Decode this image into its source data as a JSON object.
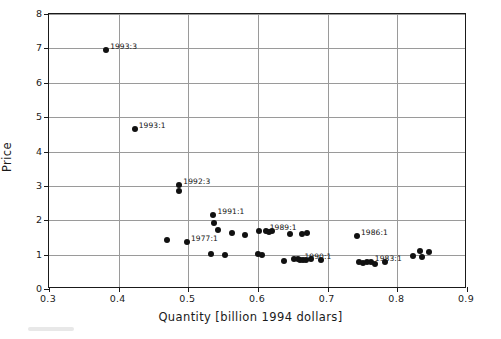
{
  "chart_data": {
    "type": "scatter",
    "title": "",
    "xlabel": "Quantity [billion 1994 dollars]",
    "ylabel": "Price",
    "xlim": [
      0.3,
      0.9
    ],
    "ylim": [
      0,
      8
    ],
    "xticks": [
      "0.3",
      "0.4",
      "0.5",
      "0.6",
      "0.7",
      "0.8",
      "0.9"
    ],
    "xtick_values": [
      0.3,
      0.4,
      0.5,
      0.6,
      0.7,
      0.8,
      0.9
    ],
    "yticks": [
      "0",
      "1",
      "2",
      "3",
      "4",
      "5",
      "6",
      "7",
      "8"
    ],
    "ytick_values": [
      0,
      1,
      2,
      3,
      4,
      5,
      6,
      7,
      8
    ],
    "grid": true,
    "legend": null,
    "marker": "filled-circle",
    "marker_color": "#111111",
    "points": [
      {
        "x": 0.382,
        "y": 6.95
      },
      {
        "x": 0.423,
        "y": 4.65
      },
      {
        "x": 0.487,
        "y": 3.02
      },
      {
        "x": 0.486,
        "y": 2.86
      },
      {
        "x": 0.536,
        "y": 2.15
      },
      {
        "x": 0.537,
        "y": 1.93
      },
      {
        "x": 0.543,
        "y": 1.72
      },
      {
        "x": 0.47,
        "y": 1.43
      },
      {
        "x": 0.498,
        "y": 1.38
      },
      {
        "x": 0.563,
        "y": 1.63
      },
      {
        "x": 0.582,
        "y": 1.56
      },
      {
        "x": 0.533,
        "y": 1.02
      },
      {
        "x": 0.552,
        "y": 0.98
      },
      {
        "x": 0.601,
        "y": 1.7
      },
      {
        "x": 0.611,
        "y": 1.68
      },
      {
        "x": 0.616,
        "y": 1.67
      },
      {
        "x": 0.62,
        "y": 1.7
      },
      {
        "x": 0.6,
        "y": 1.01
      },
      {
        "x": 0.606,
        "y": 1.0
      },
      {
        "x": 0.646,
        "y": 1.59
      },
      {
        "x": 0.663,
        "y": 1.6
      },
      {
        "x": 0.67,
        "y": 1.62
      },
      {
        "x": 0.637,
        "y": 0.82
      },
      {
        "x": 0.651,
        "y": 0.87
      },
      {
        "x": 0.657,
        "y": 0.86
      },
      {
        "x": 0.661,
        "y": 0.84
      },
      {
        "x": 0.665,
        "y": 0.83
      },
      {
        "x": 0.669,
        "y": 0.85
      },
      {
        "x": 0.676,
        "y": 0.86
      },
      {
        "x": 0.69,
        "y": 0.85
      },
      {
        "x": 0.742,
        "y": 1.55
      },
      {
        "x": 0.745,
        "y": 0.78
      },
      {
        "x": 0.751,
        "y": 0.77
      },
      {
        "x": 0.757,
        "y": 0.79
      },
      {
        "x": 0.762,
        "y": 0.78
      },
      {
        "x": 0.768,
        "y": 0.72
      },
      {
        "x": 0.782,
        "y": 0.79
      },
      {
        "x": 0.822,
        "y": 0.96
      },
      {
        "x": 0.833,
        "y": 1.12
      },
      {
        "x": 0.836,
        "y": 0.92
      },
      {
        "x": 0.845,
        "y": 1.08
      }
    ],
    "annotations": [
      {
        "label": "1993:3",
        "x": 0.382,
        "y": 6.95
      },
      {
        "label": "1993:1",
        "x": 0.423,
        "y": 4.65
      },
      {
        "label": "1992:3",
        "x": 0.487,
        "y": 3.02
      },
      {
        "label": "1991:1",
        "x": 0.536,
        "y": 2.15
      },
      {
        "label": "1977:1",
        "x": 0.498,
        "y": 1.38
      },
      {
        "label": "1989:1",
        "x": 0.611,
        "y": 1.68
      },
      {
        "label": "1990:1",
        "x": 0.661,
        "y": 0.84
      },
      {
        "label": "1986:1",
        "x": 0.742,
        "y": 1.55
      },
      {
        "label": "1983:1",
        "x": 0.762,
        "y": 0.78
      }
    ]
  }
}
